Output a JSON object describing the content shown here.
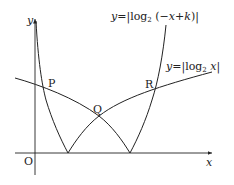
{
  "figure": {
    "type": "function-graph",
    "axes": {
      "x_label": "x",
      "y_label": "y",
      "origin_label": "O"
    },
    "curves": [
      {
        "id": "steep",
        "label_prefix": "y=|log",
        "label_base": "2",
        "label_suffix": "(−x+k)|",
        "description": "y = |log2(−x+k)|"
      },
      {
        "id": "shallow",
        "label_prefix": "y=|log",
        "label_base": "2",
        "label_suffix": " x|",
        "description": "y = |log2 x|"
      }
    ],
    "points": [
      {
        "name": "P"
      },
      {
        "name": "Q"
      },
      {
        "name": "R"
      }
    ],
    "colors": {
      "stroke": "#222222",
      "background": "#ffffff"
    }
  }
}
